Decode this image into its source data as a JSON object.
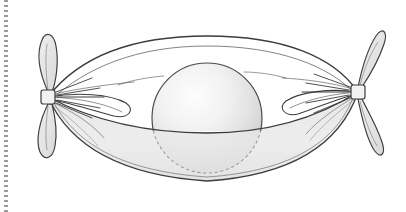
{
  "page": {
    "width": 406,
    "height": 212,
    "background_color": "#ffffff"
  },
  "binding": {
    "name": "dotted-margin",
    "position": "left",
    "x": 6,
    "dot_color": "#8a8a8a",
    "dot_spacing": 5
  },
  "figure": {
    "type": "line-drawing",
    "description": "A spherical ball enclosed in a fabric sack whose two ends are gathered and tied into knots with fanned-out leaf-shaped bow ends.",
    "stroke_color": "#3a3a3a",
    "sack": {
      "label": "sack",
      "fill_color": "#ececec",
      "upper_fill_color": "#ffffff",
      "rim_y": 130,
      "left_knot_x": 48,
      "right_knot_x": 358,
      "top_apex_y": 36,
      "bottom_apex_y": 180
    },
    "sphere": {
      "label": "sphere",
      "center_x": 207,
      "center_y": 118,
      "radius": 55,
      "highlight_color": "#fbfbfb",
      "shade_color": "#d2d2d2",
      "hidden_outline_style": "dashed",
      "hidden_outline_color": "#7d7d7d"
    },
    "knots": [
      {
        "label": "left-knot",
        "center_x": 48,
        "center_y": 97,
        "knot_size": 13,
        "lobes": 2,
        "lobe_fill": "#e4e4e4"
      },
      {
        "label": "right-knot",
        "center_x": 358,
        "center_y": 92,
        "knot_size": 13,
        "lobes": 2,
        "lobe_fill": "#e4e4e4"
      }
    ]
  }
}
